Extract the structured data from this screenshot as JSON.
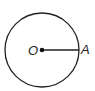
{
  "diagram": {
    "type": "circle-with-radius",
    "center_label": "O",
    "point_label": "A",
    "stroke_color": "#222222",
    "background": "#ffffff"
  }
}
